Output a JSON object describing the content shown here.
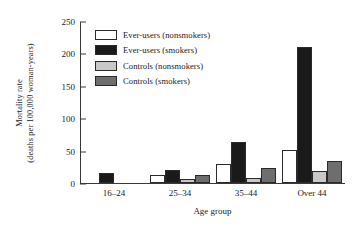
{
  "chart_data": {
    "type": "bar",
    "title": "",
    "xlabel": "Age group",
    "ylabel_line1": "Mortality rate",
    "ylabel_line2": "(deaths per 100,000 woman-years)",
    "categories": [
      "16–24",
      "25–34",
      "35–44",
      "Over 44"
    ],
    "series": [
      {
        "name": "Ever-users (nonsmokers)",
        "color": "#ffffff",
        "values": [
          0,
          13,
          29,
          51
        ]
      },
      {
        "name": "Ever-users (smokers)",
        "color": "#1a1a1a",
        "values": [
          16,
          20,
          63,
          210
        ]
      },
      {
        "name": "Controls (nonsmokers)",
        "color": "#c8c8c8",
        "values": [
          0,
          6,
          8,
          18
        ]
      },
      {
        "name": "Controls (smokers)",
        "color": "#6e6e6e",
        "values": [
          0,
          13,
          23,
          34
        ]
      }
    ],
    "yticks": [
      0,
      50,
      100,
      150,
      200,
      250
    ],
    "ylim": [
      0,
      250
    ],
    "grid": false,
    "legend_position": "upper-left-inside",
    "axis_color": "#3a3a3a",
    "bar_edge_color": "#2a2a2a"
  }
}
